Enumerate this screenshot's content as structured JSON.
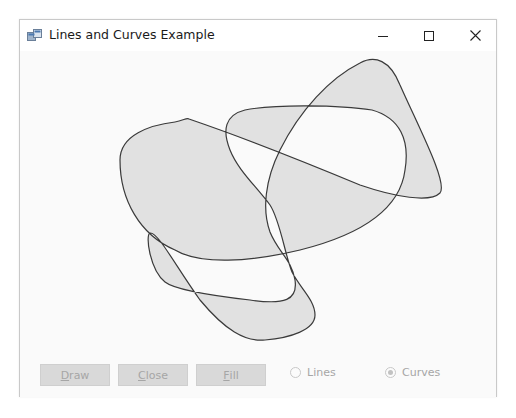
{
  "window": {
    "title": "Lines and Curves Example",
    "app_icon": "form-icon",
    "controls": {
      "minimize": "minimize-icon",
      "maximize": "maximize-icon",
      "close": "close-icon"
    }
  },
  "canvas": {
    "shape": "closed-curve",
    "fill_mode": "alternate",
    "fill_color": "#e1e1e1",
    "stroke_color": "#3a3a3a"
  },
  "buttons": [
    {
      "label_prefix": "",
      "mnemonic": "D",
      "label_rest": "raw",
      "enabled": false
    },
    {
      "label_prefix": "",
      "mnemonic": "C",
      "label_rest": "lose",
      "enabled": false
    },
    {
      "label_prefix": "",
      "mnemonic": "F",
      "label_rest": "ill",
      "enabled": false
    }
  ],
  "options": [
    {
      "label": "Lines",
      "checked": false,
      "enabled": false
    },
    {
      "label": "Curves",
      "checked": true,
      "enabled": false
    }
  ]
}
